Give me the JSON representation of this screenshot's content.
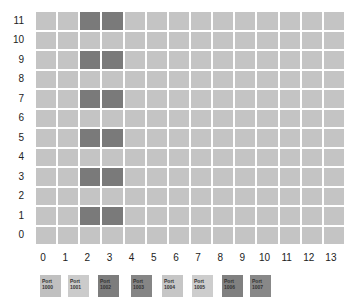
{
  "chart_data": {
    "type": "heatmap",
    "title": "",
    "xlabel": "",
    "ylabel": "",
    "x": [
      0,
      1,
      2,
      3,
      4,
      5,
      6,
      7,
      8,
      9,
      10,
      11,
      12,
      13
    ],
    "y": [
      0,
      1,
      2,
      3,
      4,
      5,
      6,
      7,
      8,
      9,
      10,
      11
    ],
    "dark_cells": [
      [
        2,
        1
      ],
      [
        3,
        1
      ],
      [
        2,
        3
      ],
      [
        3,
        3
      ],
      [
        2,
        5
      ],
      [
        3,
        5
      ],
      [
        2,
        7
      ],
      [
        3,
        7
      ],
      [
        2,
        9
      ],
      [
        3,
        9
      ],
      [
        2,
        11
      ],
      [
        3,
        11
      ]
    ],
    "colors": {
      "light": "#c4c4c4",
      "dark": "#7a7a7a"
    },
    "legend": [
      {
        "label": "Port",
        "value": "1000",
        "color": "#c0c0c0"
      },
      {
        "label": "Port",
        "value": "1001",
        "color": "#cbcbcb"
      },
      {
        "label": "Port",
        "value": "1002",
        "color": "#7d7d7d"
      },
      {
        "label": "Port",
        "value": "1003",
        "color": "#858585"
      },
      {
        "label": "Port",
        "value": "1004",
        "color": "#c6c6c6"
      },
      {
        "label": "Port",
        "value": "1005",
        "color": "#cdcdcd"
      },
      {
        "label": "Port",
        "value": "1006",
        "color": "#808080"
      },
      {
        "label": "Port",
        "value": "1007",
        "color": "#888888"
      }
    ],
    "grid": true,
    "legend_position": "bottom"
  },
  "legend_x": [
    40,
    68,
    98,
    131,
    162,
    192,
    222,
    250
  ]
}
